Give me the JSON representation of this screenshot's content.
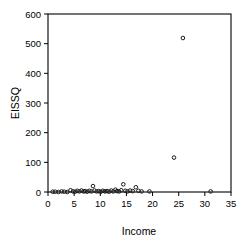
{
  "chart_data": {
    "type": "scatter",
    "title": "",
    "xlabel": "Income",
    "ylabel": "EISSQ",
    "xlim": [
      0,
      35
    ],
    "ylim": [
      0,
      600
    ],
    "xticks": [
      0,
      5,
      10,
      15,
      20,
      25,
      30,
      35
    ],
    "yticks": [
      0,
      100,
      200,
      300,
      400,
      500,
      600
    ],
    "grid": false,
    "legend": null,
    "marker": "open-circle",
    "marker_color": "#1a1a1a",
    "points": [
      {
        "x": 0.9,
        "y": 1
      },
      {
        "x": 1.4,
        "y": 1
      },
      {
        "x": 2.0,
        "y": 0
      },
      {
        "x": 2.6,
        "y": 2
      },
      {
        "x": 3.1,
        "y": 1
      },
      {
        "x": 3.7,
        "y": 0
      },
      {
        "x": 4.3,
        "y": 6
      },
      {
        "x": 4.8,
        "y": 2
      },
      {
        "x": 5.2,
        "y": 1
      },
      {
        "x": 5.6,
        "y": 4
      },
      {
        "x": 6.0,
        "y": 2
      },
      {
        "x": 6.4,
        "y": 5
      },
      {
        "x": 6.8,
        "y": 2
      },
      {
        "x": 7.1,
        "y": 3
      },
      {
        "x": 7.5,
        "y": 1
      },
      {
        "x": 7.9,
        "y": 4
      },
      {
        "x": 8.3,
        "y": 2
      },
      {
        "x": 8.6,
        "y": 20
      },
      {
        "x": 8.9,
        "y": 5
      },
      {
        "x": 9.3,
        "y": 2
      },
      {
        "x": 9.7,
        "y": 3
      },
      {
        "x": 10.1,
        "y": 1
      },
      {
        "x": 10.5,
        "y": 4
      },
      {
        "x": 10.9,
        "y": 2
      },
      {
        "x": 11.3,
        "y": 3
      },
      {
        "x": 11.7,
        "y": 1
      },
      {
        "x": 12.1,
        "y": 5
      },
      {
        "x": 12.5,
        "y": 2
      },
      {
        "x": 12.9,
        "y": 8
      },
      {
        "x": 13.2,
        "y": 3
      },
      {
        "x": 13.6,
        "y": 2
      },
      {
        "x": 14.0,
        "y": 6
      },
      {
        "x": 14.4,
        "y": 26
      },
      {
        "x": 14.8,
        "y": 4
      },
      {
        "x": 15.2,
        "y": 2
      },
      {
        "x": 15.7,
        "y": 5
      },
      {
        "x": 16.2,
        "y": 3
      },
      {
        "x": 16.8,
        "y": 16
      },
      {
        "x": 17.3,
        "y": 4
      },
      {
        "x": 17.9,
        "y": 2
      },
      {
        "x": 19.4,
        "y": 2
      },
      {
        "x": 24.1,
        "y": 116
      },
      {
        "x": 25.8,
        "y": 519
      },
      {
        "x": 31.1,
        "y": 2
      }
    ]
  },
  "axes": {
    "y_title": "EISSQ",
    "x_title": "Income",
    "y_tick_labels": [
      "0",
      "100",
      "200",
      "300",
      "400",
      "500",
      "600"
    ],
    "x_tick_labels": [
      "0",
      "5",
      "10",
      "15",
      "20",
      "25",
      "30",
      "35"
    ]
  }
}
